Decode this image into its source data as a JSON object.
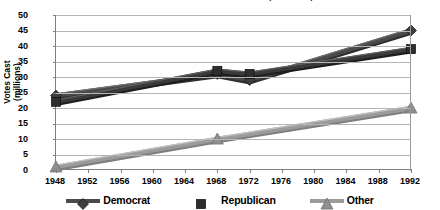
{
  "chart_data": {
    "type": "line",
    "title": "U.S. Presidential Election Votes Cast (1948-1992)",
    "xlabel": "",
    "ylabel": "Votes Cast (millions)",
    "ylabel_lines": [
      "Votes Cast",
      "(millions)"
    ],
    "x": [
      1948,
      1952,
      1956,
      1960,
      1964,
      1968,
      1972,
      1976,
      1980,
      1984,
      1988,
      1992
    ],
    "xtick_labels": [
      "1948",
      "1952",
      "1956",
      "1960",
      "1964",
      "1968",
      "1972",
      "1976",
      "1980",
      "1984",
      "1988",
      "1992"
    ],
    "ytick_labels": [
      "0",
      "5",
      "10",
      "15",
      "20",
      "25",
      "30",
      "35",
      "40",
      "45",
      "50"
    ],
    "yticks": [
      0,
      5,
      10,
      15,
      20,
      25,
      30,
      35,
      40,
      45,
      50
    ],
    "ylim": [
      0,
      50
    ],
    "xlim": [
      1948,
      1992
    ],
    "grid": "horizontal",
    "legend_position": "bottom",
    "marker_years": [
      1948,
      1968,
      1972,
      1992
    ],
    "series": [
      {
        "name": "Democrat",
        "marker": "diamond",
        "color": "#4a4a4a",
        "points": [
          {
            "x": 1948,
            "y": 24
          },
          {
            "x": 1968,
            "y": 31
          },
          {
            "x": 1972,
            "y": 29
          },
          {
            "x": 1992,
            "y": 45
          }
        ]
      },
      {
        "name": "Republican",
        "marker": "square",
        "color": "#3a3a3a",
        "points": [
          {
            "x": 1948,
            "y": 22
          },
          {
            "x": 1968,
            "y": 32
          },
          {
            "x": 1972,
            "y": 31
          },
          {
            "x": 1992,
            "y": 39
          }
        ]
      },
      {
        "name": "Other",
        "marker": "triangle",
        "color": "#9b9b9b",
        "points": [
          {
            "x": 1948,
            "y": 1
          },
          {
            "x": 1968,
            "y": 10
          },
          {
            "x": 1992,
            "y": 20
          }
        ]
      }
    ]
  },
  "legend": {
    "items": [
      {
        "label": "Democrat",
        "marker": "diamond-marker-icon"
      },
      {
        "label": "Republican",
        "marker": "square-marker-icon"
      },
      {
        "label": "Other",
        "marker": "triangle-marker-icon"
      }
    ]
  },
  "axes": {
    "y_title_line1": "Votes Cast",
    "y_title_line2": "(millions)"
  }
}
